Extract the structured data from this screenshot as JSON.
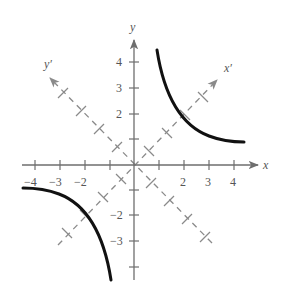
{
  "figure": {
    "axes": {
      "x_label": "x",
      "y_label": "y",
      "x_prime_label": "x′",
      "y_prime_label": "y′",
      "x_tick_labels": [
        "−4",
        "−3",
        "−2",
        "2",
        "3",
        "4"
      ],
      "y_tick_labels": [
        "4",
        "3",
        "2",
        "−2",
        "−3"
      ],
      "x_range": [
        -4,
        4
      ],
      "y_range": [
        -4,
        4
      ]
    },
    "curve": {
      "equation": "xy = 4",
      "branches": [
        "quadrant I",
        "quadrant III"
      ]
    },
    "colors": {
      "axis": "#6e6e6e",
      "curve": "#111111",
      "rotated_axis": "#8a8a8a",
      "label": "#555555"
    }
  }
}
